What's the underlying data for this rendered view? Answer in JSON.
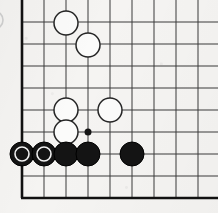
{
  "diagram": {
    "kind": "go-board-corner-diagram",
    "board": {
      "origin_x": 22,
      "origin_y": 22,
      "cell": 22,
      "cols": 9,
      "rows": 9,
      "left_edge_x": 22,
      "bottom_edge_y": 198,
      "line_color": "#3a3a3a",
      "edge_color": "#111111",
      "background_color": "#f5f4f2"
    },
    "stone_radius": 12,
    "hoshi_radius": 3.5,
    "star_points": [
      {
        "name": "star-point-3-4",
        "cx": 88,
        "cy": 132
      }
    ],
    "white_stones": [
      {
        "name": "white-stone-1",
        "cx": 66,
        "cy": 23
      },
      {
        "name": "white-stone-2",
        "cx": 88,
        "cy": 45
      },
      {
        "name": "white-stone-3",
        "cx": 66,
        "cy": 110
      },
      {
        "name": "white-stone-4",
        "cx": 110,
        "cy": 110
      },
      {
        "name": "white-stone-5",
        "cx": 66,
        "cy": 132
      }
    ],
    "black_stones": [
      {
        "name": "black-stone-1",
        "cx": 22,
        "cy": 154,
        "marked": true
      },
      {
        "name": "black-stone-2",
        "cx": 44,
        "cy": 154,
        "marked": true
      },
      {
        "name": "black-stone-3",
        "cx": 66,
        "cy": 154,
        "marked": false
      },
      {
        "name": "black-stone-4",
        "cx": 88,
        "cy": 154,
        "marked": false
      },
      {
        "name": "black-stone-5",
        "cx": 132,
        "cy": 154,
        "marked": false
      }
    ],
    "marker": {
      "type": "white-circle-mark",
      "radius": 7,
      "color": "#f2f2f2"
    },
    "edge_fragment": {
      "name": "cropped-stone-edge-fragment",
      "cx": -6,
      "cy": 20,
      "r": 9
    },
    "colors": {
      "white_stone": "#fbfbfa",
      "black_stone": "#141414",
      "grid": "#3a3a3a",
      "edge": "#111111",
      "paper": "#f5f4f2"
    }
  }
}
